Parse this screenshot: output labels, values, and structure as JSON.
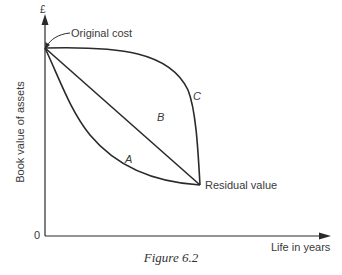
{
  "figure": {
    "caption": "Figure 6.2",
    "y_axis_unit": "£",
    "y_axis_label": "Book value of assets",
    "x_axis_label": "Life in years",
    "origin_label": "0",
    "annotations": {
      "original_cost": "Original cost",
      "residual_value": "Residual value"
    },
    "curves": [
      {
        "label": "A",
        "description": "declines rapidly early (convex)"
      },
      {
        "label": "B",
        "description": "straight-line decline"
      },
      {
        "label": "C",
        "description": "declines slowly early (concave)"
      }
    ]
  },
  "colors": {
    "line": "#2a2a2a",
    "text": "#3a3a3a"
  }
}
